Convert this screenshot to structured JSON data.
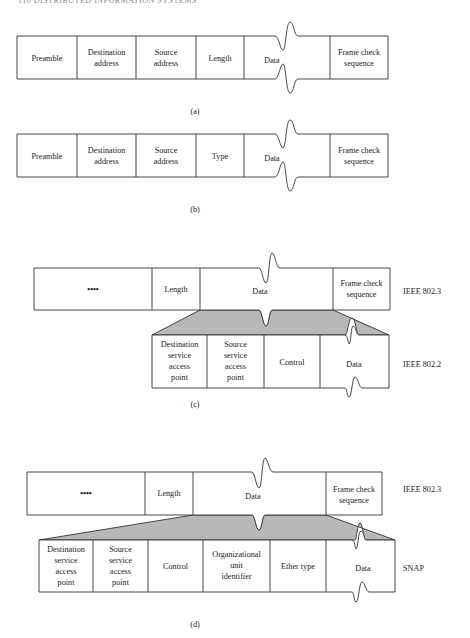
{
  "page": {
    "running_header": "118 DISTRIBUTED INFORMATION SYSTEMS"
  },
  "figures": {
    "a": {
      "caption": "(a)",
      "fields": [
        "Preamble",
        "Destination address",
        "Source address",
        "Length",
        "Data",
        "Frame check sequence"
      ]
    },
    "b": {
      "caption": "(b)",
      "fields": [
        "Preamble",
        "Destination address",
        "Source address",
        "Type",
        "Data",
        "Frame check sequence"
      ]
    },
    "c": {
      "caption": "(c)",
      "outer": {
        "label": "IEEE 802.3",
        "fields": [
          "••••",
          "Length",
          "Data",
          "Frame check sequence"
        ]
      },
      "inner": {
        "label": "IEEE 802.2",
        "fields": [
          "Destination service access point",
          "Source service access point",
          "Control",
          "Data"
        ]
      }
    },
    "d": {
      "caption": "(d)",
      "outer": {
        "label": "IEEE 802.3",
        "fields": [
          "••••",
          "Length",
          "Data",
          "Frame check sequence"
        ]
      },
      "inner": {
        "label": "SNAP",
        "fields": [
          "Destination service access point",
          "Source service access point",
          "Control",
          "Organizational unit identifier",
          "Ether type",
          "Data"
        ]
      }
    }
  },
  "colors": {
    "line": "#333333",
    "shade": "#b8b8b8",
    "background": "#ffffff"
  }
}
